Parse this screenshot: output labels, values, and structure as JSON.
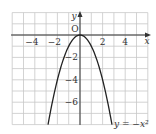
{
  "chart_data": {
    "type": "line",
    "title": "",
    "xlabel": "x",
    "ylabel": "y",
    "origin_label": "O",
    "xlim": [
      -6,
      6
    ],
    "ylim": [
      -8,
      2
    ],
    "grid": true,
    "x_ticks": [
      {
        "value": -4,
        "label": "−4"
      },
      {
        "value": -2,
        "label": "−2"
      },
      {
        "value": 2,
        "label": "2"
      },
      {
        "value": 4,
        "label": "4"
      }
    ],
    "y_ticks": [
      {
        "value": -2,
        "label": "−2"
      },
      {
        "value": -4,
        "label": "−4"
      },
      {
        "value": -6,
        "label": "−6"
      }
    ],
    "series": [
      {
        "name": "y = −x²",
        "equation": "y = -x^2",
        "x": [
          -2.83,
          -2.5,
          -2,
          -1.5,
          -1,
          -0.5,
          0,
          0.5,
          1,
          1.5,
          2,
          2.5,
          2.83
        ],
        "y": [
          -8,
          -6.25,
          -4,
          -2.25,
          -1,
          -0.25,
          0,
          -0.25,
          -1,
          -2.25,
          -4,
          -6.25,
          -8
        ]
      }
    ],
    "annotations": [
      {
        "text": "y = −x²",
        "position": "bottom-right"
      }
    ]
  }
}
